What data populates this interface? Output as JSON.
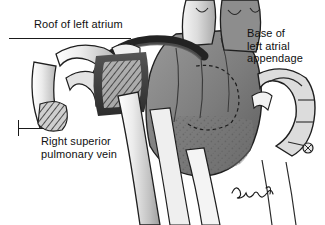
{
  "figure": {
    "kind": "medical-anatomical-illustration",
    "background_color": "#ffffff",
    "text_color": "#101010",
    "leader_line_color": "#1a1a1a"
  },
  "labels": {
    "roof": {
      "text": "Roof of left atrium",
      "lines": [
        "Roof of left atrium"
      ]
    },
    "base": {
      "text": "Base of\nleft atrial\nappendage",
      "lines": [
        "Base of",
        "left atrial",
        "appendage"
      ]
    },
    "rspv": {
      "text": "Right superior\npulmonary vein",
      "lines": [
        "Right superior",
        "pulmonary vein"
      ]
    }
  },
  "signature": {
    "artist_mark": "Bensel",
    "style": "cursive-handwritten"
  },
  "palette": {
    "white": "#ffffff",
    "vessel_light": "#e8e8e8",
    "vessel_mid": "#c9c9c9",
    "tissue_mid": "#8a8a8a",
    "tissue_dark": "#4a4a4a",
    "outline": "#1f1f1f",
    "shadow": "#2b2b2b"
  }
}
